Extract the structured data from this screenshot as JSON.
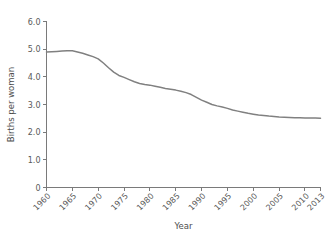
{
  "chart_data": {
    "type": "line",
    "title": "",
    "xlabel": "Year",
    "ylabel": "Births per woman",
    "xlim": [
      1960,
      2013
    ],
    "ylim": [
      0,
      6
    ],
    "grid": false,
    "legend": false,
    "line_color": "#808080",
    "axis_color": "#7a7a7a",
    "background_color": "#ffffff",
    "xticks": [
      "1960",
      "1965",
      "1970",
      "1975",
      "1980",
      "1985",
      "1990",
      "1995",
      "2000",
      "2005",
      "2010",
      "2013"
    ],
    "xtick_values": [
      1960,
      1965,
      1970,
      1975,
      1980,
      1985,
      1990,
      1995,
      2000,
      2005,
      2010,
      2013
    ],
    "yticks": [
      "0",
      "1.0",
      "2.0",
      "3.0",
      "4.0",
      "5.0",
      "6.0"
    ],
    "ytick_values": [
      0,
      1,
      2,
      3,
      4,
      5,
      6
    ],
    "x": [
      1960,
      1961,
      1962,
      1963,
      1964,
      1965,
      1966,
      1967,
      1968,
      1969,
      1970,
      1971,
      1972,
      1973,
      1974,
      1975,
      1976,
      1977,
      1978,
      1979,
      1980,
      1981,
      1982,
      1983,
      1984,
      1985,
      1986,
      1987,
      1988,
      1989,
      1990,
      1991,
      1992,
      1993,
      1994,
      1995,
      1996,
      1997,
      1998,
      1999,
      2000,
      2001,
      2002,
      2003,
      2004,
      2005,
      2006,
      2007,
      2008,
      2009,
      2010,
      2011,
      2012,
      2013
    ],
    "values": [
      4.9,
      4.91,
      4.92,
      4.93,
      4.94,
      4.94,
      4.9,
      4.85,
      4.79,
      4.73,
      4.65,
      4.5,
      4.33,
      4.17,
      4.05,
      3.98,
      3.9,
      3.82,
      3.76,
      3.72,
      3.7,
      3.66,
      3.62,
      3.58,
      3.55,
      3.52,
      3.48,
      3.43,
      3.36,
      3.26,
      3.16,
      3.08,
      3.0,
      2.95,
      2.91,
      2.86,
      2.8,
      2.76,
      2.72,
      2.68,
      2.65,
      2.62,
      2.6,
      2.58,
      2.57,
      2.55,
      2.54,
      2.53,
      2.52,
      2.52,
      2.51,
      2.51,
      2.51,
      2.5
    ],
    "series": [
      {
        "name": "Births per woman",
        "values": [
          4.9,
          4.91,
          4.92,
          4.93,
          4.94,
          4.94,
          4.9,
          4.85,
          4.79,
          4.73,
          4.65,
          4.5,
          4.33,
          4.17,
          4.05,
          3.98,
          3.9,
          3.82,
          3.76,
          3.72,
          3.7,
          3.66,
          3.62,
          3.58,
          3.55,
          3.52,
          3.48,
          3.43,
          3.36,
          3.26,
          3.16,
          3.08,
          3.0,
          2.95,
          2.91,
          2.86,
          2.8,
          2.76,
          2.72,
          2.68,
          2.65,
          2.62,
          2.6,
          2.58,
          2.57,
          2.55,
          2.54,
          2.53,
          2.52,
          2.52,
          2.51,
          2.51,
          2.51,
          2.5
        ]
      }
    ]
  }
}
